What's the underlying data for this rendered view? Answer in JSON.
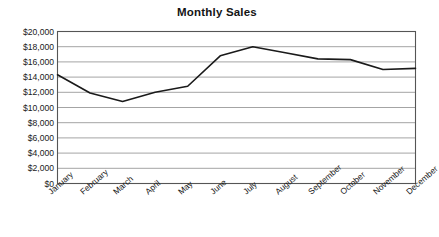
{
  "chart_data": {
    "type": "line",
    "title": "Monthly Sales",
    "xlabel": "",
    "ylabel": "",
    "categories": [
      "January",
      "February",
      "March",
      "April",
      "May",
      "June",
      "July",
      "August",
      "September",
      "October",
      "November",
      "December"
    ],
    "values": [
      14300,
      11900,
      10800,
      12000,
      12800,
      16800,
      18000,
      17200,
      16400,
      16300,
      15000,
      15150
    ],
    "series": [
      {
        "name": "Monthly Sales",
        "values": [
          14300,
          11900,
          10800,
          12000,
          12800,
          16800,
          18000,
          17200,
          16400,
          16300,
          15000,
          15150
        ]
      }
    ],
    "ylim": [
      0,
      20000
    ],
    "ytick_values": [
      0,
      2000,
      4000,
      6000,
      8000,
      10000,
      12000,
      14000,
      16000,
      18000,
      20000
    ],
    "ytick_labels": [
      "$0",
      "$2,000",
      "$4,000",
      "$6,000",
      "$8,000",
      "$10,000",
      "$12,000",
      "$14,000",
      "$16,000",
      "$18,000",
      "$20,000"
    ],
    "grid": "horizontal",
    "legend": "none",
    "line_color": "#1a1a1a",
    "grid_color": "#9a9a9a",
    "border_color": "#555555",
    "background_color": "#ffffff",
    "xtick_rotation": -41,
    "markers": "none"
  }
}
